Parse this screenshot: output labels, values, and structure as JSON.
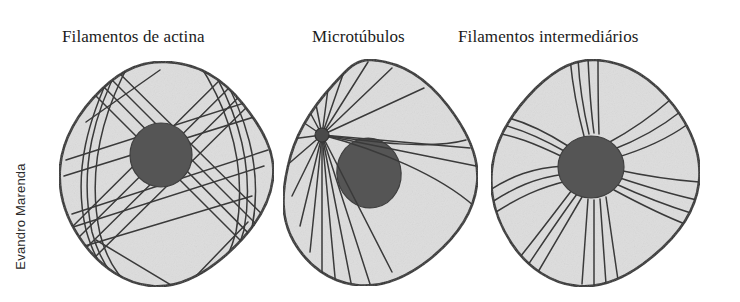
{
  "figure": {
    "type": "biology-diagram",
    "credit": "Evandro Marenda",
    "panels": [
      {
        "id": "actin",
        "label": "Filamentos de actina",
        "filament_pattern": "criss-cross straight bundles spanning the whole cytoplasm",
        "has_centrosome": false
      },
      {
        "id": "microtubules",
        "label": "Microtúbulos",
        "filament_pattern": "radiating straight lines from a single centrosome at the left",
        "has_centrosome": true
      },
      {
        "id": "intermediate",
        "label": "Filamentos intermediários",
        "filament_pattern": "wavy bundles radiating outward from around the nucleus",
        "has_centrosome": false
      }
    ],
    "colors": {
      "background": "#ffffff",
      "cytoplasm_fill": "#dddddd",
      "cell_outline": "#2b2b2b",
      "nucleus_fill": "#555555",
      "nucleus_outline": "#3a3a3a",
      "filament_stroke": "#3a3a3a",
      "label_text": "#1b1b1b",
      "credit_text": "#2b2b2b"
    }
  }
}
